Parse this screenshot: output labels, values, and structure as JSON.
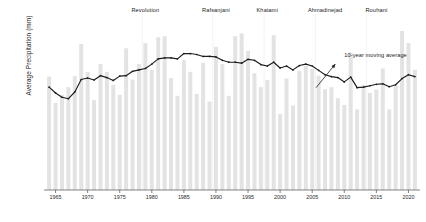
{
  "chart_data": {
    "type": "bar",
    "title": "",
    "xlabel": "",
    "ylabel": "Average Precipitation (mm)",
    "xlim": [
      1963.2,
      2021.8
    ],
    "ylim": [
      0,
      358
    ],
    "grid": false,
    "legend": "none",
    "bar_color": "#e3e3e3",
    "line_color": "#1c1c1c",
    "axis_color": "#4d4d4d",
    "xticks": [
      1965,
      1970,
      1975,
      1980,
      1985,
      1990,
      1995,
      2000,
      2005,
      2010,
      2015,
      2020
    ],
    "yticks": [
      25,
      50,
      75,
      100,
      125,
      150,
      175,
      200,
      225,
      250,
      275,
      300,
      325,
      350
    ],
    "categories": [
      1964,
      1965,
      1966,
      1967,
      1968,
      1969,
      1970,
      1971,
      1972,
      1973,
      1974,
      1975,
      1976,
      1977,
      1978,
      1979,
      1980,
      1981,
      1982,
      1983,
      1984,
      1985,
      1986,
      1987,
      1988,
      1989,
      1990,
      1991,
      1992,
      1993,
      1994,
      1995,
      1996,
      1997,
      1998,
      1999,
      2000,
      2001,
      2002,
      2003,
      2004,
      2005,
      2006,
      2007,
      2008,
      2009,
      2010,
      2011,
      2012,
      2013,
      2014,
      2015,
      2016,
      2017,
      2018,
      2019,
      2020,
      2021
    ],
    "values": [
      236,
      181,
      198,
      214,
      237,
      304,
      246,
      187,
      262,
      246,
      219,
      198,
      295,
      230,
      262,
      306,
      250,
      318,
      320,
      233,
      196,
      270,
      246,
      200,
      265,
      184,
      298,
      262,
      196,
      320,
      326,
      290,
      243,
      214,
      229,
      322,
      158,
      232,
      176,
      248,
      258,
      252,
      238,
      210,
      214,
      191,
      177,
      286,
      168,
      219,
      202,
      209,
      253,
      168,
      217,
      331,
      306,
      250
    ],
    "series": [
      {
        "name": "10-year moving average",
        "type": "line",
        "x": [
          1964,
          1965,
          1966,
          1967,
          1968,
          1969,
          1970,
          1971,
          1972,
          1973,
          1974,
          1975,
          1976,
          1977,
          1978,
          1979,
          1980,
          1981,
          1982,
          1983,
          1984,
          1985,
          1986,
          1987,
          1988,
          1989,
          1990,
          1991,
          1992,
          1993,
          1994,
          1995,
          1996,
          1997,
          1998,
          1999,
          2000,
          2001,
          2002,
          2003,
          2004,
          2005,
          2006,
          2007,
          2008,
          2009,
          2010,
          2011,
          2012,
          2013,
          2014,
          2015,
          2016,
          2017,
          2018,
          2019,
          2020,
          2021
        ],
        "values": [
          214,
          202,
          193,
          190,
          204,
          230,
          233,
          229,
          238,
          234,
          228,
          237,
          238,
          247,
          250,
          253,
          262,
          273,
          275,
          275,
          273,
          284,
          284,
          282,
          278,
          278,
          277,
          270,
          266,
          266,
          264,
          272,
          270,
          261,
          258,
          266,
          254,
          258,
          250,
          259,
          262,
          258,
          249,
          240,
          236,
          234,
          225,
          235,
          213,
          214,
          217,
          220,
          221,
          215,
          219,
          232,
          240,
          236
        ]
      }
    ],
    "annotations": [
      {
        "name": "era-label",
        "text": "Revolution",
        "x": 1979
      },
      {
        "name": "era-label",
        "text": "Rafsanjani",
        "x": 1990
      },
      {
        "name": "era-label",
        "text": "Khatami",
        "x": 1998
      },
      {
        "name": "era-label",
        "text": "Ahmadinejad",
        "x": 2007
      },
      {
        "name": "era-label",
        "text": "Rouhani",
        "x": 2015
      },
      {
        "name": "series-callout",
        "text": "10-year moving average",
        "x": 2010,
        "y": 281
      }
    ]
  },
  "annotation_text": "10-year moving average"
}
